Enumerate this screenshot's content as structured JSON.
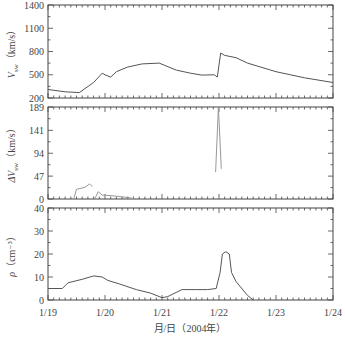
{
  "figure": {
    "xlabel": "月/日（2004年）",
    "x_ticks": [
      "1/19",
      "1/20",
      "1/21",
      "1/22",
      "1/23",
      "1/24"
    ]
  },
  "chart_data": [
    {
      "type": "line",
      "title": "",
      "ylabel": "V_sw（km/s）",
      "ylabel_main": "V",
      "ylabel_sub": "sw",
      "ylabel_unit": "（km/s）",
      "xlabel": "月/日（2004年）",
      "x_tick_labels": [
        "1/19",
        "1/20",
        "1/21",
        "1/22",
        "1/23",
        "1/24"
      ],
      "ylim": [
        200,
        1400
      ],
      "y_ticks": [
        200,
        500,
        800,
        1100,
        1400
      ],
      "grid": false,
      "color": "#555555",
      "series": [
        {
          "name": "V_sw",
          "x_days": [
            0,
            0.3,
            0.55,
            0.8,
            0.95,
            1.0,
            1.1,
            1.2,
            1.4,
            1.65,
            1.95,
            2.25,
            2.5,
            2.7,
            2.92,
            2.97,
            3.03,
            3.1,
            3.3,
            3.5,
            4.0,
            4.5,
            5.0
          ],
          "values": [
            310,
            280,
            270,
            400,
            520,
            500,
            470,
            540,
            600,
            640,
            650,
            560,
            520,
            495,
            500,
            470,
            780,
            750,
            720,
            650,
            540,
            460,
            400
          ]
        }
      ]
    },
    {
      "type": "line",
      "title": "",
      "ylabel": "ΔV_sw（km/s）",
      "ylabel_main": "ΔV",
      "ylabel_sub": "sw",
      "ylabel_unit": "（km/s）",
      "ylim": [
        0,
        189
      ],
      "y_ticks": [
        0,
        47,
        94,
        141,
        189
      ],
      "grid": false,
      "color": "#999999",
      "series": [
        {
          "name": "segment-1",
          "x_days": [
            0.45,
            0.5,
            0.65,
            0.73,
            0.78
          ],
          "values": [
            0,
            20,
            24,
            31,
            25
          ]
        },
        {
          "name": "segment-2",
          "x_days": [
            0.82,
            0.88,
            0.95,
            1.1,
            1.4,
            1.55
          ],
          "values": [
            0,
            15,
            8,
            7,
            3,
            0
          ]
        },
        {
          "name": "spike",
          "x_days": [
            2.94,
            2.99,
            3.04
          ],
          "values": [
            55,
            189,
            62
          ]
        }
      ]
    },
    {
      "type": "line",
      "title": "",
      "ylabel": "ρ（cm⁻³）",
      "ylabel_main": "ρ",
      "ylabel_unit": "（cm⁻³）",
      "ylim": [
        0,
        40
      ],
      "y_ticks": [
        0,
        10,
        20,
        30,
        40
      ],
      "grid": false,
      "color": "#555555",
      "series": [
        {
          "name": "rho",
          "x_days": [
            0,
            0.25,
            0.35,
            0.6,
            0.8,
            0.95,
            1.05,
            1.25,
            1.55,
            1.8,
            2.0,
            2.1,
            2.35,
            2.6,
            2.8,
            2.95,
            3.02,
            3.06,
            3.12,
            3.18,
            3.22,
            3.3,
            3.5,
            3.6
          ],
          "values": [
            5,
            5,
            7.5,
            9,
            10.5,
            10,
            8.5,
            7,
            4.5,
            3,
            1,
            1.5,
            4.5,
            4.5,
            4.5,
            5,
            12,
            20,
            21,
            20,
            12,
            8,
            2,
            0
          ]
        }
      ]
    }
  ]
}
